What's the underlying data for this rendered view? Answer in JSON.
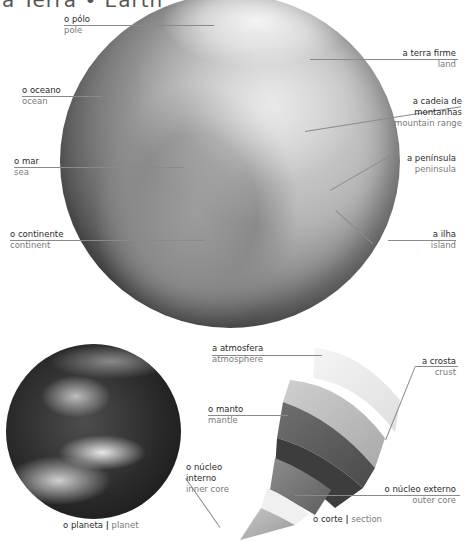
{
  "header": {
    "title": "a Terra • Earth"
  },
  "main_globe": {
    "labels": [
      {
        "pt": "o pólo",
        "en": "pole"
      },
      {
        "pt": "o oceano",
        "en": "ocean"
      },
      {
        "pt": "o mar",
        "en": "sea"
      },
      {
        "pt": "o continente",
        "en": "continent"
      },
      {
        "pt": "a terra firme",
        "en": "land"
      },
      {
        "pt": "a cadeia de montanhas",
        "pt_line1": "a cadeia de",
        "pt_line2": "montanhas",
        "en": "mountain range"
      },
      {
        "pt": "a península",
        "en": "peninsula"
      },
      {
        "pt": "a ilha",
        "en": "island"
      }
    ]
  },
  "planet": {
    "caption_pt": "o planeta",
    "caption_sep": "|",
    "caption_en": "planet"
  },
  "section": {
    "caption_pt": "o corte",
    "caption_sep": "|",
    "caption_en": "section",
    "labels": [
      {
        "pt": "a atmosfera",
        "en": "atmosphere"
      },
      {
        "pt": "a crosta",
        "en": "crust"
      },
      {
        "pt": "o manto",
        "en": "mantle"
      },
      {
        "pt": "o núcleo interno",
        "pt_line1": "o núcleo",
        "pt_line2": "interno",
        "en": "inner core"
      },
      {
        "pt": "o núcleo externo",
        "en": "outer core"
      }
    ]
  }
}
